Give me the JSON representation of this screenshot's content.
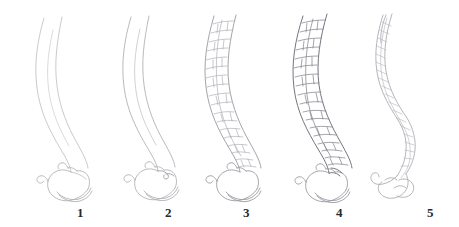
{
  "figure": {
    "kind": "scientific-line-drawing",
    "medium": "pencil line drawing",
    "title": "",
    "caption": "",
    "background_color": "#ffffff",
    "width_px": 459,
    "height_px": 227,
    "stage_count": 5,
    "colors": {
      "outline_faint": "#b9b9bd",
      "outline_light": "#a3a3a9",
      "outline_medium": "#8a8a92",
      "outline_dark": "#6e6e78",
      "scale_lines": "#9a9aa2",
      "label_text": "#2a2a2a"
    },
    "stages": [
      {
        "number": "1",
        "label": "1",
        "label_x": 77,
        "label_y": 206,
        "description": "bare double-curve outline, no surface texture; closed bird-head hook at base",
        "line_weight": "faint",
        "has_scales": false,
        "scale_rows": 0,
        "base_form": "closed hook",
        "tip_state": "open"
      },
      {
        "number": "2",
        "label": "2",
        "label_x": 165,
        "label_y": 206,
        "description": "same outline slightly firmer, small knot at junction of hook and shaft; still untextured",
        "line_weight": "light",
        "has_scales": false,
        "scale_rows": 0,
        "base_form": "closed hook with knot",
        "tip_state": "open"
      },
      {
        "number": "3",
        "label": "3",
        "label_x": 243,
        "label_y": 206,
        "description": "shaft filled with polygonal plate-like scales in transverse rows",
        "line_weight": "medium",
        "has_scales": true,
        "scale_rows": 22,
        "base_form": "closed hook",
        "tip_state": "open"
      },
      {
        "number": "4",
        "label": "4",
        "label_x": 336,
        "label_y": 206,
        "description": "fully developed, widest shaft with dense dark polygonal scales throughout",
        "line_weight": "dark",
        "has_scales": true,
        "scale_rows": 24,
        "base_form": "closed hook",
        "tip_state": "open"
      },
      {
        "number": "5",
        "label": "5",
        "label_x": 427,
        "label_y": 206,
        "description": "narrowed twisted shaft with oblique braided striations; base uncoils into an open curled hook",
        "line_weight": "light",
        "has_scales": true,
        "scale_rows": 18,
        "base_form": "open curl",
        "tip_state": "open split"
      }
    ]
  }
}
